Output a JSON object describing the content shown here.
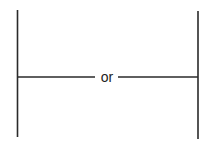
{
  "diagram": {
    "connector_label": "or",
    "line_color": "#2a2a2a",
    "left_bar": {
      "x": 17.5,
      "y1": 10,
      "y2": 137
    },
    "right_bar": {
      "x": 198,
      "y1": 11,
      "y2": 139
    },
    "connector": {
      "y": 77,
      "x1": 18,
      "x2": 198
    }
  }
}
